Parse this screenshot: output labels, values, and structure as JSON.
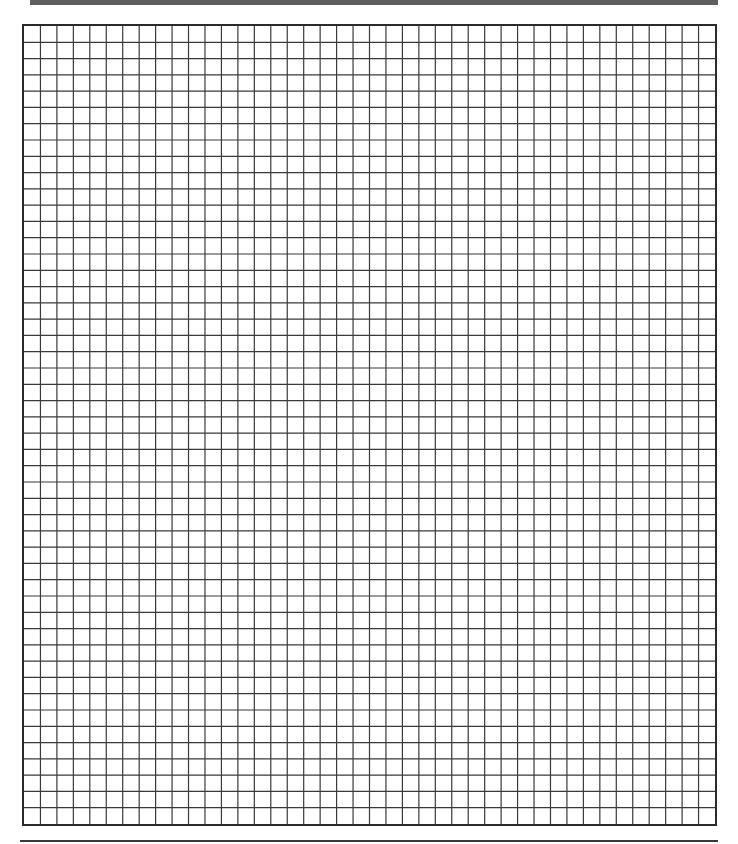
{
  "page": {
    "type": "graph-paper-sheet",
    "background_color": "#ffffff"
  },
  "header_bar": {
    "color": "#5f5f5f"
  },
  "grid": {
    "columns": 42,
    "rows": 49,
    "line_color": "#3a3a3a",
    "border_color": "#2a2a2a"
  },
  "footer_rule": {
    "color": "#3a3a3a"
  }
}
